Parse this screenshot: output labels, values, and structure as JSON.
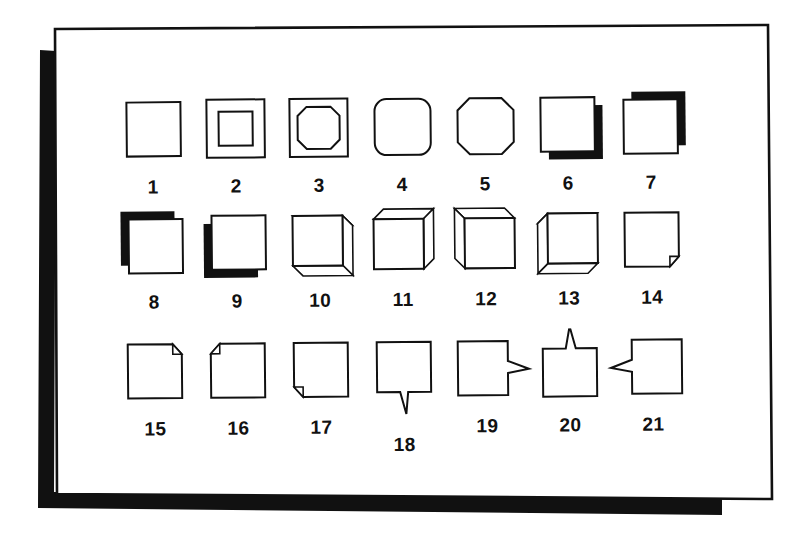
{
  "figure": {
    "title": "",
    "caption": "",
    "background_color": "#ffffff",
    "ink_color": "#111111",
    "shadow_color": "#111111",
    "frame": {
      "name": "page-frame",
      "style": "thin rectangle with thick black offset drop shadow on left and bottom",
      "rotation_degrees": -0.55
    },
    "rows": 3,
    "columns": 7,
    "total_items": 21
  },
  "items": [
    {
      "number": "1",
      "name": "plain-square",
      "description": "plain square outline"
    },
    {
      "number": "2",
      "name": "double-square",
      "description": "square with inner square border"
    },
    {
      "number": "3",
      "name": "square-with-inner-octagon",
      "description": "square with inner chamfered octagon"
    },
    {
      "number": "4",
      "name": "rounded-square",
      "description": "square with rounded corners"
    },
    {
      "number": "5",
      "name": "chamfered-square",
      "description": "square with cut/beveled corners"
    },
    {
      "number": "6",
      "name": "shadow-square-down-right",
      "description": "square with solid shadow offset down-right"
    },
    {
      "number": "7",
      "name": "shadow-square-up-right",
      "description": "square with solid shadow offset up-right"
    },
    {
      "number": "8",
      "name": "shadow-square-up-left",
      "description": "square with solid shadow offset up-left"
    },
    {
      "number": "9",
      "name": "shadow-square-down-left",
      "description": "square with solid shadow offset down-left"
    },
    {
      "number": "10",
      "name": "box-3d-down-right",
      "description": "3D box extruded toward lower-right"
    },
    {
      "number": "11",
      "name": "box-3d-up-right",
      "description": "3D box extruded toward upper-right"
    },
    {
      "number": "12",
      "name": "box-3d-up-left",
      "description": "3D box extruded toward upper-left"
    },
    {
      "number": "13",
      "name": "box-3d-down-left",
      "description": "3D box extruded toward lower-left"
    },
    {
      "number": "14",
      "name": "folded-corner-bottom-right",
      "description": "page with folded corner at bottom-right"
    },
    {
      "number": "15",
      "name": "folded-corner-top-right",
      "description": "page with folded corner at top-right"
    },
    {
      "number": "16",
      "name": "folded-corner-top-left",
      "description": "page with folded corner at top-left"
    },
    {
      "number": "17",
      "name": "folded-corner-bottom-left",
      "description": "page with folded corner at bottom-left"
    },
    {
      "number": "18",
      "name": "callout-tail-down",
      "description": "speech balloon with tail pointing down"
    },
    {
      "number": "19",
      "name": "callout-tail-right",
      "description": "speech balloon with tail pointing right"
    },
    {
      "number": "20",
      "name": "callout-tail-up",
      "description": "speech balloon with tail pointing up"
    },
    {
      "number": "21",
      "name": "callout-tail-left",
      "description": "speech balloon with tail pointing left"
    }
  ]
}
